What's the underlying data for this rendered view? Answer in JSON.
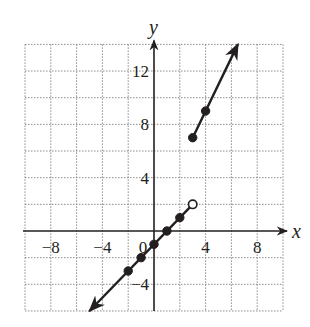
{
  "chart_data": {
    "type": "line",
    "title": "",
    "xlabel": "x",
    "ylabel": "y",
    "xlim": [
      -10,
      10
    ],
    "ylim": [
      -6,
      14
    ],
    "grid": true,
    "grid_step": 2,
    "legend": null,
    "x_ticks": [
      -8,
      -4,
      0,
      4,
      8
    ],
    "x_tick_labels": [
      "−8",
      "−4",
      "0",
      "4",
      "8"
    ],
    "y_ticks": [
      -4,
      4,
      8,
      12
    ],
    "y_tick_labels": [
      "−4",
      "4",
      "8",
      "12"
    ],
    "series": [
      {
        "name": "lower piece",
        "equation": "y = x - 1, x < 3",
        "line_from": [
          -5,
          -6
        ],
        "line_to": [
          3,
          2
        ],
        "arrow_at_start": true,
        "arrow_at_end": false,
        "closed_points": [
          [
            -2,
            -3
          ],
          [
            -1,
            -2
          ],
          [
            0,
            -1
          ],
          [
            1,
            0
          ],
          [
            2,
            1
          ]
        ],
        "open_points": [
          [
            3,
            2
          ]
        ]
      },
      {
        "name": "upper piece",
        "equation": "y = 2x + 1, x >= 3",
        "line_from": [
          3,
          7
        ],
        "line_to": [
          6.5,
          14
        ],
        "arrow_at_start": false,
        "arrow_at_end": true,
        "closed_points": [
          [
            3,
            7
          ],
          [
            4,
            9
          ]
        ],
        "open_points": []
      }
    ]
  },
  "colors": {
    "ink": "#231f20",
    "grid": "#8a8a8a",
    "background": "#ffffff"
  }
}
